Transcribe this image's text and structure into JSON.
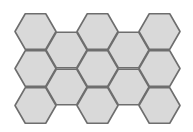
{
  "diagram": {
    "type": "hexagon-grid",
    "orientation": "flat-top",
    "colors": {
      "fill": "#d9d9d9",
      "stroke": "#6e6e6e",
      "background": "#ffffff"
    },
    "hex": {
      "radius": 20.5,
      "stroke_width": 1.6
    },
    "cells": [
      {
        "col": 0,
        "row": 0,
        "cx": 35.5,
        "cy": 31.5
      },
      {
        "col": 0,
        "row": 1,
        "cx": 35.5,
        "cy": 68.5
      },
      {
        "col": 0,
        "row": 2,
        "cx": 35.5,
        "cy": 105.5
      },
      {
        "col": 1,
        "row": 0,
        "cx": 66.5,
        "cy": 50
      },
      {
        "col": 1,
        "row": 1,
        "cx": 66.5,
        "cy": 87
      },
      {
        "col": 2,
        "row": 0,
        "cx": 97.5,
        "cy": 31.5
      },
      {
        "col": 2,
        "row": 1,
        "cx": 97.5,
        "cy": 68.5
      },
      {
        "col": 2,
        "row": 2,
        "cx": 97.5,
        "cy": 105.5
      },
      {
        "col": 3,
        "row": 0,
        "cx": 128.5,
        "cy": 50
      },
      {
        "col": 3,
        "row": 1,
        "cx": 128.5,
        "cy": 87
      },
      {
        "col": 4,
        "row": 0,
        "cx": 159.5,
        "cy": 31.5
      },
      {
        "col": 4,
        "row": 1,
        "cx": 159.5,
        "cy": 68.5
      },
      {
        "col": 4,
        "row": 2,
        "cx": 159.5,
        "cy": 105.5
      }
    ]
  }
}
